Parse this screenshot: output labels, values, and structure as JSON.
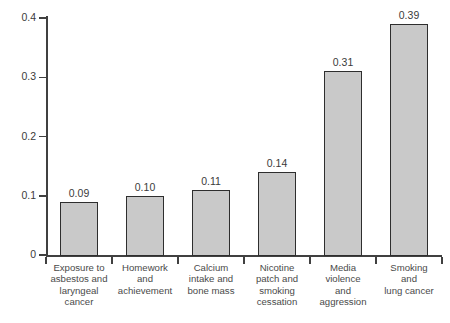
{
  "chart_data": {
    "type": "bar",
    "title": "",
    "subtitle": "",
    "xlabel": "",
    "ylabel": "",
    "ylim": [
      0,
      0.4
    ],
    "grid": false,
    "legend": "none",
    "y_ticks": [
      "0",
      "0.1",
      "0.2",
      "0.3",
      "0.4"
    ],
    "y_tick_values": [
      0,
      0.1,
      0.2,
      0.3,
      0.4
    ],
    "categories": [
      "Exposure to asbestos and laryngeal cancer",
      "Homework and achievement",
      "Calcium intake and bone mass",
      "Nicotine patch and smoking cessation",
      "Media violence and aggression",
      "Smoking and lung cancer"
    ],
    "category_lines": [
      [
        "Exposure to",
        "asbestos and",
        "laryngeal",
        "cancer"
      ],
      [
        "Homework",
        "and",
        "achievement"
      ],
      [
        "Calcium",
        "intake and",
        "bone mass"
      ],
      [
        "Nicotine",
        "patch and",
        "smoking",
        "cessation"
      ],
      [
        "Media",
        "violence",
        "and",
        "aggression"
      ],
      [
        "Smoking",
        "and",
        "lung cancer"
      ]
    ],
    "values": [
      0.09,
      0.1,
      0.11,
      0.14,
      0.31,
      0.39
    ],
    "value_labels": [
      "0.09",
      "0.10",
      "0.11",
      "0.14",
      "0.31",
      "0.39"
    ],
    "colors": {
      "bar_fill": "#c9c9c9",
      "bar_border": "#2e2e2e",
      "axis": "#404040",
      "text": "#3a3a3a",
      "background": "#ffffff"
    }
  }
}
